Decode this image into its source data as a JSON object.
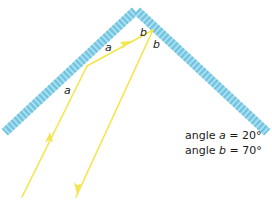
{
  "diagram": {
    "type": "two-mirror reflection (corner reflector)",
    "colors": {
      "mirror": "#8fd8ef",
      "mirror_hatch": "#5fb7d6",
      "ray": "#f4e64a",
      "text": "#1a1a1a",
      "background": "#ffffff"
    },
    "angle_labels": {
      "a_reflected": "a",
      "a_incident": "a",
      "b_incident": "b",
      "b_reflected": "b"
    },
    "caption": {
      "line1_prefix": "angle ",
      "line1_var": "a",
      "line1_suffix": " = 20°",
      "line2_prefix": "angle ",
      "line2_var": "b",
      "line2_suffix": " = 70°"
    },
    "values": {
      "angle_a_deg": 20,
      "angle_b_deg": 70
    }
  }
}
